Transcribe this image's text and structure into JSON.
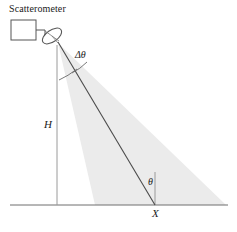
{
  "figure": {
    "title": "Scatterometer",
    "width": 237,
    "height": 232,
    "background_color": "#ffffff"
  },
  "labels": {
    "title": "Scatterometer",
    "delta_theta": "Δθ",
    "height": "H",
    "theta": "θ",
    "ground_point": "X"
  },
  "colors": {
    "line": "#3f3f3f",
    "beam_fill": "#ebebeb",
    "ground_line": "#6e6e6e",
    "vertical_line": "#8a8a8a",
    "text": "#1a1a1a"
  },
  "geometry": {
    "instrument_box": {
      "x": 11,
      "y": 20,
      "width": 25,
      "height": 20
    },
    "connector": {
      "from_x": 36,
      "from_y": 30,
      "elbow_x": 45,
      "to_x": 45,
      "to_y": 37
    },
    "antenna_dish": {
      "cx": 52,
      "cy": 36,
      "rx": 11,
      "ry": 5.5,
      "rotation_deg": -35
    },
    "beam_apex": {
      "x": 58,
      "y": 43
    },
    "beam_left_ground": {
      "x": 95,
      "y": 205
    },
    "beam_right_ground": {
      "x": 226,
      "y": 205
    },
    "nadir_line": {
      "x": 57,
      "y_top": 45,
      "y_bottom": 205
    },
    "boresight_line": {
      "x1": 58,
      "y1": 42,
      "x2": 155,
      "y2": 205
    },
    "ground_line": {
      "x1": 10,
      "x2": 228,
      "y": 205
    },
    "local_vertical_at_x": {
      "x": 155,
      "y_top": 172,
      "y_bottom": 205
    },
    "beam_tick_near": {
      "x1": 60,
      "y1": 78,
      "x2": 76,
      "y2": 70
    },
    "beam_tick_far": {
      "x1": 74,
      "y1": 71,
      "x2": 86,
      "y2": 63
    }
  }
}
